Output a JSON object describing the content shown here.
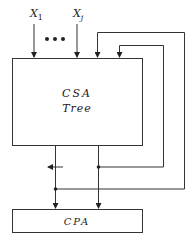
{
  "diagram": {
    "type": "block-diagram",
    "inputs": [
      {
        "label": "X",
        "subscript": "1"
      },
      {
        "label": "X",
        "subscript": "j"
      }
    ],
    "ellipsis": "•••",
    "blocks": {
      "csa": {
        "line1": "CSA",
        "line2": "Tree"
      },
      "cpa": {
        "label": "CPA"
      }
    },
    "colors": {
      "stroke": "#333333",
      "background": "#ffffff"
    }
  }
}
